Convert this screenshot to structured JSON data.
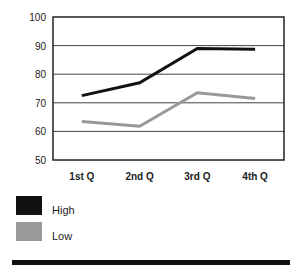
{
  "chart_data": {
    "type": "line",
    "title": "",
    "xlabel": "",
    "ylabel": "",
    "categories": [
      "1st Q",
      "2nd Q",
      "3rd Q",
      "4th Q"
    ],
    "series": [
      {
        "name": "High",
        "color": "#111111",
        "values": [
          72.5,
          77,
          89,
          88.7
        ]
      },
      {
        "name": "Low",
        "color": "#999999",
        "values": [
          63.5,
          61.8,
          73.5,
          71.5
        ]
      }
    ],
    "ylim": [
      50,
      100
    ],
    "yticks": [
      "50",
      "60",
      "70",
      "80",
      "90",
      "100"
    ],
    "grid": true,
    "legend_position": "bottom-left"
  },
  "legend": {
    "items": [
      {
        "label": "High",
        "color": "#111111"
      },
      {
        "label": "Low",
        "color": "#999999"
      }
    ]
  }
}
